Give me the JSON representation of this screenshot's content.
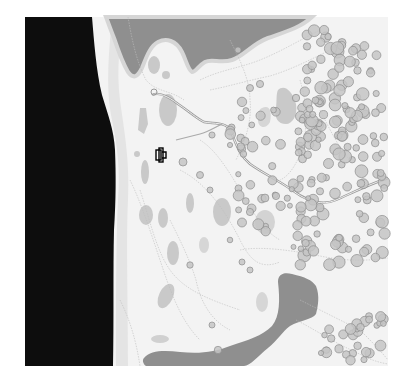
{
  "map": {
    "type": "topographic-map",
    "colors": {
      "background": "#ffffff",
      "void": "#0c0c0c",
      "land": "#f2f2f2",
      "land_light": "#f7f7f7",
      "shore_band": "#e6e6e6",
      "water": "#8e8e8e",
      "low_area": "#c8c8c8",
      "contour": "#b8b8b8",
      "path": "#9a9a9a",
      "tree_fill": "#bdbdbd",
      "tree_stroke": "#8a8a8a",
      "marker": "#000000"
    },
    "features": {
      "lakes": [
        "north-lake",
        "south-lake"
      ],
      "void_region": "west-edge",
      "trail": "winding-trail",
      "forest": "eastern-forest"
    },
    "player_marker": {
      "icon": "player-marker-icon"
    }
  }
}
